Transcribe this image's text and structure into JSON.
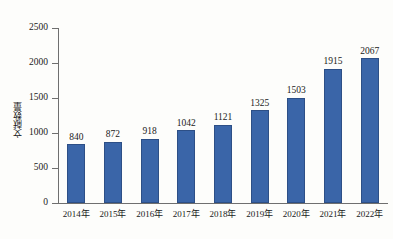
{
  "chart_data": {
    "type": "bar",
    "title": "",
    "xlabel": "",
    "ylabel": "文献数量",
    "categories": [
      "2014年",
      "2015年",
      "2016年",
      "2017年",
      "2018年",
      "2019年",
      "2020年",
      "2021年",
      "2022年"
    ],
    "values": [
      840,
      872,
      918,
      1042,
      1121,
      1325,
      1503,
      1915,
      2067
    ],
    "ylim": [
      0,
      2500
    ],
    "ytick_labels": [
      "0",
      "500",
      "1000",
      "1500",
      "2000",
      "2500"
    ],
    "ytick_values": [
      0,
      500,
      1000,
      1500,
      2000,
      2500
    ],
    "grid": false,
    "legend": false,
    "data_labels": true,
    "series": [
      {
        "name": "文献数量",
        "values": [
          840,
          872,
          918,
          1042,
          1121,
          1325,
          1503,
          1915,
          2067
        ]
      }
    ]
  },
  "style": {
    "bar_color": "#3a65a8",
    "bar_border_color": "#2d4f86",
    "axis_color": "#6f6f6f",
    "text_color": "#1a1a1a",
    "background": "#fdfdfb"
  }
}
